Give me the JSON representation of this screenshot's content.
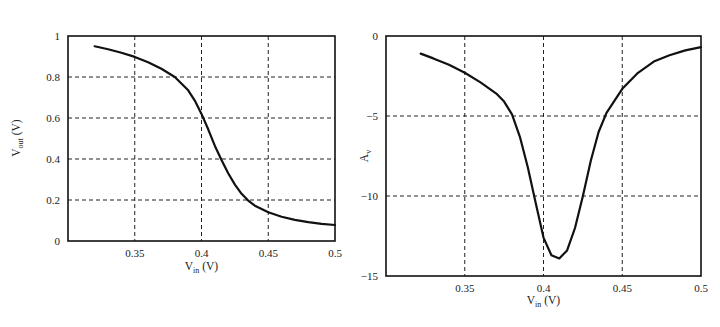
{
  "chart_data": [
    {
      "type": "line",
      "title": "",
      "xlabel": "V_in (V)",
      "xlabel_main": "V",
      "xlabel_sub": "in",
      "xlabel_unit": " (V)",
      "ylabel": "V_out (V)",
      "ylabel_main": "V",
      "ylabel_sub": "out",
      "ylabel_unit": " (V)",
      "xlim": [
        0.3,
        0.5
      ],
      "ylim": [
        0,
        1
      ],
      "xticks": [
        0.35,
        0.4,
        0.45,
        0.5
      ],
      "xtick_labels": [
        "0.35",
        "0.4",
        "0.45",
        "0.5"
      ],
      "yticks": [
        0,
        0.2,
        0.4,
        0.6,
        0.8,
        1
      ],
      "ytick_labels": [
        "0",
        "0.2",
        "0.4",
        "0.6",
        "0.8",
        "1"
      ],
      "grid": true,
      "legend": null,
      "series": [
        {
          "name": "Vout",
          "x": [
            0.32,
            0.33,
            0.34,
            0.35,
            0.36,
            0.37,
            0.38,
            0.39,
            0.395,
            0.4,
            0.405,
            0.41,
            0.415,
            0.42,
            0.425,
            0.43,
            0.435,
            0.44,
            0.45,
            0.46,
            0.47,
            0.48,
            0.49,
            0.5
          ],
          "values": [
            0.95,
            0.935,
            0.918,
            0.898,
            0.872,
            0.84,
            0.8,
            0.735,
            0.685,
            0.62,
            0.545,
            0.465,
            0.395,
            0.33,
            0.275,
            0.23,
            0.197,
            0.172,
            0.14,
            0.118,
            0.103,
            0.092,
            0.084,
            0.078
          ]
        }
      ]
    },
    {
      "type": "line",
      "title": "",
      "xlabel": "V_in (V)",
      "xlabel_main": "V",
      "xlabel_sub": "in",
      "xlabel_unit": " (V)",
      "ylabel": "A_v",
      "ylabel_main": "A",
      "ylabel_sub": "v",
      "ylabel_unit": "",
      "xlim": [
        0.3,
        0.5
      ],
      "ylim": [
        -15,
        0
      ],
      "xticks": [
        0.35,
        0.4,
        0.45,
        0.5
      ],
      "xtick_labels": [
        "0.35",
        "0.4",
        "0.45",
        "0.5"
      ],
      "yticks": [
        -15,
        -10,
        -5,
        0
      ],
      "ytick_labels": [
        "−15",
        "−10",
        "−5",
        "0"
      ],
      "grid": true,
      "legend": null,
      "series": [
        {
          "name": "Av",
          "x": [
            0.322,
            0.33,
            0.34,
            0.35,
            0.36,
            0.37,
            0.375,
            0.38,
            0.385,
            0.39,
            0.395,
            0.4,
            0.405,
            0.41,
            0.415,
            0.42,
            0.425,
            0.43,
            0.435,
            0.44,
            0.45,
            0.46,
            0.47,
            0.48,
            0.49,
            0.5
          ],
          "values": [
            -1.1,
            -1.4,
            -1.8,
            -2.3,
            -2.9,
            -3.6,
            -4.1,
            -4.9,
            -6.3,
            -8.2,
            -10.4,
            -12.6,
            -13.7,
            -13.9,
            -13.4,
            -12.0,
            -10.0,
            -7.8,
            -6.0,
            -4.8,
            -3.3,
            -2.3,
            -1.6,
            -1.2,
            -0.9,
            -0.7
          ]
        }
      ]
    }
  ]
}
